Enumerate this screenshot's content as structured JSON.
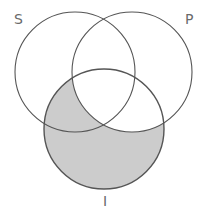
{
  "diagram": {
    "type": "venn",
    "shaded_region": "I minus P",
    "colors": {
      "shade": "#cccccc",
      "stroke": "#555555",
      "label": "#6a6a6a",
      "background": "#ffffff"
    },
    "circles": [
      {
        "id": "S",
        "label": "S",
        "cx": 75,
        "cy": 72,
        "r": 60,
        "label_x": 14,
        "label_y": 24
      },
      {
        "id": "P",
        "label": "P",
        "cx": 132,
        "cy": 72,
        "r": 60,
        "label_x": 185,
        "label_y": 24
      },
      {
        "id": "I",
        "label": "I",
        "cx": 104,
        "cy": 129,
        "r": 60,
        "label_x": 103,
        "label_y": 206
      }
    ]
  }
}
